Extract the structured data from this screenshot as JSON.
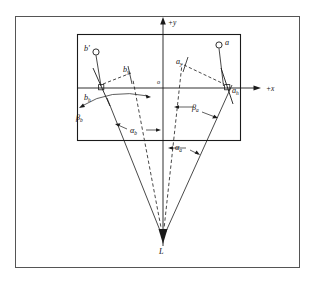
{
  "figure": {
    "axes": {
      "y_label": "+y",
      "x_label": "+x",
      "origin_label": "o"
    },
    "points": {
      "lens": "L",
      "object_a": "a",
      "object_b": "b'",
      "image_a_h": "a",
      "image_a_h_sub": "h",
      "image_b_h": "b",
      "image_b_h_sub": "h",
      "coord_a_y": "a",
      "coord_a_y_sub": "y",
      "coord_b_y": "b",
      "coord_b_y_sub": "y"
    },
    "angles": {
      "alpha_a": "α",
      "alpha_a_sub": "a",
      "alpha_b": "α",
      "alpha_b_sub": "b",
      "beta_a": "β",
      "beta_a_sub": "a",
      "beta_b": "β",
      "beta_b_sub": "b"
    },
    "colors": {
      "line": "#1a1a1a",
      "frame": "#4a4a4a",
      "background": "#ffffff"
    },
    "geometry": {
      "outer_frame": {
        "x": 15,
        "y": 16,
        "width": 285,
        "height": 252
      },
      "inner_rect": {
        "x": 77,
        "y": 34,
        "width": 164,
        "height": 107
      },
      "origin": {
        "x": 163,
        "y": 88
      },
      "lens_point": {
        "x": 163,
        "y": 238
      },
      "a_h": {
        "x": 228,
        "y": 88
      },
      "b_h": {
        "x": 103,
        "y": 88
      },
      "a_circle": {
        "x": 219,
        "y": 45
      },
      "b_circle": {
        "x": 96,
        "y": 52
      },
      "x_axis_end": {
        "x": 262,
        "y": 88
      },
      "y_axis_top": {
        "x": 163,
        "y": 22
      }
    }
  }
}
